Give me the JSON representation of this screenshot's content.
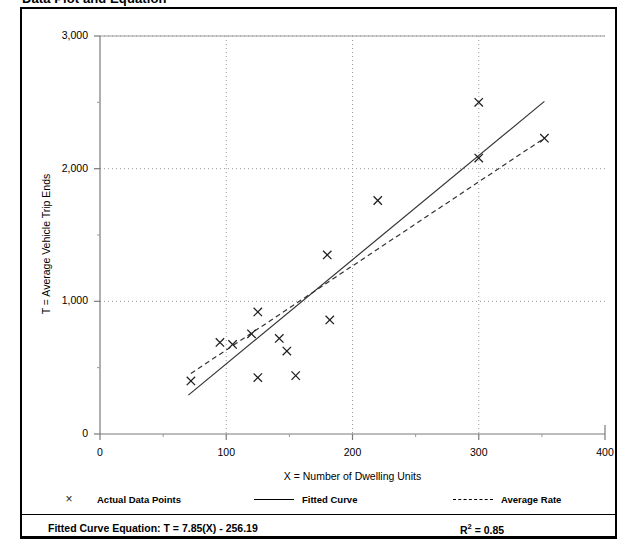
{
  "title": "Data Plot and Equation",
  "legend": {
    "items": [
      {
        "label": "Actual Data Points",
        "key": "x-marker",
        "color": "#222222"
      },
      {
        "label": "Fitted Curve",
        "key": "solid-line",
        "color": "#000000"
      },
      {
        "label": "Average Rate",
        "key": "dashed-line",
        "color": "#000000"
      }
    ]
  },
  "equation": {
    "label": "Fitted Curve Equation:  T = 7.85(X) - 256.19",
    "r2_prefix": "R",
    "r2_exponent": "2",
    "r2_value": " = 0.85"
  },
  "chart_data": {
    "type": "scatter",
    "title": "Data Plot and Equation",
    "xlabel": "X = Number of Dwelling Units",
    "ylabel": "T = Average Vehicle Trip Ends",
    "xlim": [
      0,
      400
    ],
    "ylim": [
      0,
      3000
    ],
    "x_ticks": [
      0,
      100,
      200,
      300,
      400
    ],
    "x_tick_labels": [
      "0",
      "100",
      "200",
      "300",
      "400"
    ],
    "x_minor_ticks": [
      50,
      150,
      250,
      350
    ],
    "y_ticks": [
      0,
      1000,
      2000,
      3000
    ],
    "y_tick_labels": [
      "0",
      "1,000",
      "2,000",
      "3,000"
    ],
    "y_minor_ticks": [
      500,
      1500,
      2500
    ],
    "grid": "dotted",
    "legend_position": "below-plot",
    "series": [
      {
        "name": "Actual Data Points",
        "type": "scatter",
        "marker": "x",
        "points": [
          [
            72,
            400
          ],
          [
            95,
            690
          ],
          [
            105,
            675
          ],
          [
            120,
            755
          ],
          [
            125,
            920
          ],
          [
            125,
            425
          ],
          [
            142,
            720
          ],
          [
            148,
            625
          ],
          [
            155,
            440
          ],
          [
            180,
            1350
          ],
          [
            182,
            860
          ],
          [
            220,
            1760
          ],
          [
            300,
            2500
          ],
          [
            300,
            2080
          ],
          [
            352,
            2230
          ]
        ]
      },
      {
        "name": "Fitted Curve",
        "type": "line",
        "style": "solid",
        "equation": "T = 7.85(X) - 256.19",
        "slope": 7.85,
        "intercept": -256.19,
        "r_squared": 0.85,
        "x_range": [
          70,
          352
        ],
        "endpoints": [
          [
            70,
            293
          ],
          [
            352,
            2507
          ]
        ]
      },
      {
        "name": "Average Rate",
        "type": "line",
        "style": "dashed",
        "slope": 6.34,
        "intercept": 0,
        "x_range": [
          72,
          352
        ],
        "endpoints": [
          [
            72,
            456
          ],
          [
            352,
            2230
          ]
        ]
      }
    ]
  }
}
